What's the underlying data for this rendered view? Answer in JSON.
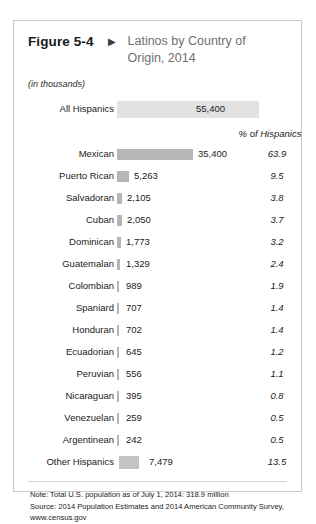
{
  "figure": {
    "label": "Figure 5-4",
    "marker_icon": "triangle-right-icon",
    "title": "Latinos by Country of Origin, 2014",
    "units_note": "(in thousands)"
  },
  "columns": {
    "percent_header": "% of Hispanics"
  },
  "total_row": {
    "label": "All Hispanics",
    "value": "55,400"
  },
  "chart_data": {
    "type": "bar",
    "title": "Latinos by Country of Origin, 2014",
    "subtitle": "(in thousands)",
    "xlabel": "",
    "ylabel": "",
    "orientation": "horizontal",
    "value_unit": "thousands",
    "total_label": "All Hispanics",
    "total_value": 55400,
    "total_value_text": "55,400",
    "percent_column_header": "% of Hispanics",
    "categories": [
      "Mexican",
      "Puerto Rican",
      "Salvadoran",
      "Cuban",
      "Dominican",
      "Guatemalan",
      "Colombian",
      "Spaniard",
      "Honduran",
      "Ecuadorian",
      "Peruvian",
      "Nicaraguan",
      "Venezuelan",
      "Argentinean",
      "Other Hispanics"
    ],
    "values": [
      35400,
      5263,
      2105,
      2050,
      1773,
      1329,
      989,
      707,
      702,
      645,
      556,
      395,
      259,
      242,
      7479
    ],
    "value_labels": [
      "35,400",
      "5,263",
      "2,105",
      "2,050",
      "1,773",
      "1,329",
      "989",
      "707",
      "702",
      "645",
      "556",
      "395",
      "259",
      "242",
      "7,479"
    ],
    "percents": [
      63.9,
      9.5,
      3.8,
      3.7,
      3.2,
      2.4,
      1.9,
      1.4,
      1.4,
      1.2,
      1.1,
      0.8,
      0.5,
      0.5,
      13.5
    ],
    "percent_labels": [
      "63.9",
      "9.5",
      "3.8",
      "3.7",
      "3.2",
      "2.4",
      "1.9",
      "1.4",
      "1.4",
      "1.2",
      "1.1",
      "0.8",
      "0.5",
      "0.5",
      "13.5"
    ],
    "bar_color": "#b6b6b6",
    "grid": false,
    "legend": "none"
  },
  "rows": [
    {
      "label": "Mexican",
      "value": "35,400",
      "percent": "63.9",
      "bar_px": 76,
      "val_px": 184
    },
    {
      "label": "Puerto Rican",
      "value": "5,263",
      "percent": "9.5",
      "bar_px": 12,
      "val_px": 120
    },
    {
      "label": "Salvadoran",
      "value": "2,105",
      "percent": "3.8",
      "bar_px": 5,
      "val_px": 113
    },
    {
      "label": "Cuban",
      "value": "2,050",
      "percent": "3.7",
      "bar_px": 5,
      "val_px": 113
    },
    {
      "label": "Dominican",
      "value": "1,773",
      "percent": "3.2",
      "bar_px": 4,
      "val_px": 112
    },
    {
      "label": "Guatemalan",
      "value": "1,329",
      "percent": "2.4",
      "bar_px": 3,
      "val_px": 112
    },
    {
      "label": "Colombian",
      "value": "989",
      "percent": "1.9",
      "bar_px": 2,
      "val_px": 112
    },
    {
      "label": "Spaniard",
      "value": "707",
      "percent": "1.4",
      "bar_px": 2,
      "val_px": 112
    },
    {
      "label": "Honduran",
      "value": "702",
      "percent": "1.4",
      "bar_px": 2,
      "val_px": 112
    },
    {
      "label": "Ecuadorian",
      "value": "645",
      "percent": "1.2",
      "bar_px": 2,
      "val_px": 112
    },
    {
      "label": "Peruvian",
      "value": "556",
      "percent": "1.1",
      "bar_px": 2,
      "val_px": 112
    },
    {
      "label": "Nicaraguan",
      "value": "395",
      "percent": "0.8",
      "bar_px": 2,
      "val_px": 112
    },
    {
      "label": "Venezuelan",
      "value": "259",
      "percent": "0.5",
      "bar_px": 2,
      "val_px": 112
    },
    {
      "label": "Argentinean",
      "value": "242",
      "percent": "0.5",
      "bar_px": 2,
      "val_px": 112
    }
  ],
  "other_row": {
    "label": "Other Hispanics",
    "value": "7,479",
    "percent": "13.5"
  },
  "footnotes": {
    "note": "Note: Total U.S. population as of July 1, 2014:  318.9 million",
    "source": "Source: 2014 Population Estimates and 2014 American Community Survey,",
    "url": "www.census.gov"
  },
  "colors": {
    "bar": "#b6b6b6",
    "band": "#e2e2e2",
    "border": "#c9c9c9",
    "title_text": "#6f6f6f"
  }
}
